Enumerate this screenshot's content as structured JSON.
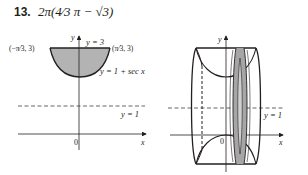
{
  "problem": {
    "number": "13.",
    "answer": "2π(4⁄3 π − √3)"
  },
  "left_figure": {
    "y_axis_label": "y",
    "x_axis_label": "x",
    "origin_label": "0",
    "left_point_label": "(−π⁄3, 3)",
    "right_point_label": "(π⁄3, 3)",
    "top_line_label": "y = 3",
    "curve_label": "y = 1 + sec x",
    "dashed_line_label": "y = 1",
    "fill_color": "#b3b3b3",
    "line_color": "#231f20"
  },
  "right_figure": {
    "y_axis_label": "y",
    "x_axis_label": "x",
    "origin_label": "0",
    "dashed_line_label": "y = 1",
    "fill_color": "#a6a6a6",
    "line_color": "#231f20"
  }
}
